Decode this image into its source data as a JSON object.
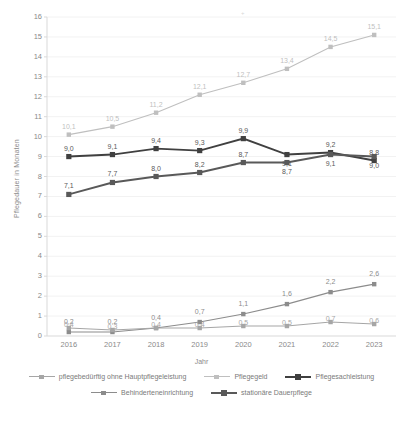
{
  "axes": {
    "xlabel": "Jahr",
    "ylabel": "Pflegedauer in Monaten",
    "xticks": [
      "2016",
      "2017",
      "2018",
      "2019",
      "2020",
      "2021",
      "2022",
      "2023"
    ],
    "yticks": [
      "16",
      "15",
      "14",
      "13",
      "12",
      "11",
      "10",
      "9",
      "8",
      "7",
      "6",
      "5",
      "4",
      "3",
      "2",
      "1",
      "0"
    ]
  },
  "legend": {
    "row1": [
      {
        "label": "pflegebedürftig ohne Hauptpflegeleistung",
        "color": "#a6a6a6",
        "weight": "thin"
      },
      {
        "label": "Pflegegeld",
        "color": "#bfbfbf",
        "weight": "thin"
      },
      {
        "label": "Pflegesachleistung",
        "color": "#404040",
        "weight": "thick"
      }
    ],
    "row2": [
      {
        "label": "Behinderteneinrichtung",
        "color": "#8c8c8c",
        "weight": "thin"
      },
      {
        "label": "stationäre Dauerpflege",
        "color": "#595959",
        "weight": "thick"
      }
    ]
  },
  "chart_data": {
    "type": "line",
    "title": "",
    "xlabel": "Jahr",
    "ylabel": "Pflegedauer in Monaten",
    "categories": [
      "2016",
      "2017",
      "2018",
      "2019",
      "2020",
      "2021",
      "2022",
      "2023"
    ],
    "ylim": [
      0,
      16
    ],
    "grid": true,
    "legend_position": "bottom",
    "series": [
      {
        "name": "Pflegegeld",
        "color": "#bfbfbf",
        "values": [
          10.1,
          10.5,
          11.2,
          12.1,
          12.7,
          13.4,
          14.5,
          15.1
        ],
        "labels": [
          "10,1",
          "10,5",
          "11,2",
          "12,1",
          "12,7",
          "13,4",
          "14,5",
          "15,1"
        ]
      },
      {
        "name": "Pflegesachleistung",
        "color": "#404040",
        "values": [
          9.0,
          9.1,
          9.4,
          9.3,
          9.9,
          9.1,
          9.2,
          8.8
        ],
        "labels": [
          "9,0",
          "9,1",
          "9,4",
          "9,3",
          "9,9",
          "9,1",
          "9,2",
          "8,8"
        ]
      },
      {
        "name": "stationäre Dauerpflege",
        "color": "#595959",
        "values": [
          7.1,
          7.7,
          8.0,
          8.2,
          8.7,
          8.7,
          9.1,
          9.0
        ],
        "labels": [
          "7,1",
          "7,7",
          "8,0",
          "8,2",
          "8,7",
          "8,7",
          "9,1",
          "9,0"
        ]
      },
      {
        "name": "Behinderteneinrichtung",
        "color": "#8c8c8c",
        "values": [
          0.2,
          0.2,
          0.4,
          0.7,
          1.1,
          1.6,
          2.2,
          2.6
        ],
        "labels": [
          "0,2",
          "0,2",
          "0,4",
          "0,7",
          "1,1",
          "1,6",
          "2,2",
          "2,6"
        ]
      },
      {
        "name": "pflegebedürftig ohne Hauptpflegeleistung",
        "color": "#a6a6a6",
        "values": [
          0.4,
          0.3,
          0.4,
          0.4,
          0.5,
          0.5,
          0.7,
          0.6
        ],
        "labels": [
          "0,4",
          "0,3",
          "0,4",
          "0,4",
          "0,5",
          "0,5",
          "0,7",
          "0,6"
        ]
      }
    ]
  }
}
